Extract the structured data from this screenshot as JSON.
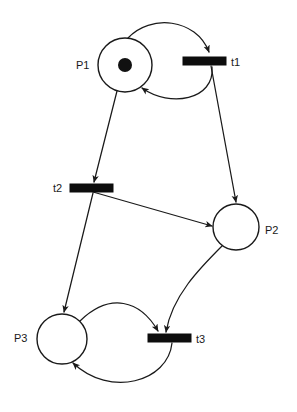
{
  "diagram": {
    "width": 297,
    "height": 412,
    "background_color": "#ffffff",
    "stroke_color": "#1a1a1a",
    "fill_color": "#0d0d0d"
  },
  "places": [
    {
      "id": "P1",
      "label": "P1",
      "cx": 125,
      "cy": 65,
      "r": 27,
      "tokens": 1,
      "token_radius": 7,
      "label_x": 76,
      "label_y": 69
    },
    {
      "id": "P2",
      "label": "P2",
      "cx": 236,
      "cy": 227,
      "r": 23,
      "tokens": 0,
      "token_radius": 0,
      "label_x": 265,
      "label_y": 234
    },
    {
      "id": "P3",
      "label": "P3",
      "cx": 62,
      "cy": 339,
      "r": 25,
      "tokens": 0,
      "token_radius": 0,
      "label_x": 14,
      "label_y": 342
    }
  ],
  "transitions": [
    {
      "id": "t1",
      "label": "t1",
      "x": 183,
      "y": 57,
      "width": 43,
      "height": 8,
      "label_x": 231,
      "label_y": 66
    },
    {
      "id": "t2",
      "label": "t2",
      "x": 70,
      "y": 184,
      "width": 43,
      "height": 8,
      "label_x": 53,
      "label_y": 192
    },
    {
      "id": "t3",
      "label": "t3",
      "x": 148,
      "y": 334,
      "width": 43,
      "height": 8,
      "label_x": 196,
      "label_y": 343
    }
  ],
  "arcs": [
    {
      "id": "arc-p1-to-t1",
      "from": "P1",
      "to": "t1",
      "shape": "curve",
      "path": "M 128 38 C 150 14 196 18 209 52",
      "arrowhead": true,
      "description": "P1 top curves right and down into t1"
    },
    {
      "id": "arc-t1-to-p1",
      "from": "t1",
      "to": "P1",
      "shape": "curve",
      "path": "M 212 67 C 215 100 170 108 142 88",
      "arrowhead": true,
      "description": "t1 curves left and up back into P1 lower right"
    },
    {
      "id": "arc-t1-to-p2",
      "from": "t1",
      "to": "P2",
      "shape": "line",
      "path": "M 211 66 L 236 202",
      "arrowhead": true,
      "description": "straight line from t1 down to P2 top"
    },
    {
      "id": "arc-p1-to-t2",
      "from": "P1",
      "to": "t2",
      "shape": "line",
      "path": "M 117 91 L 94 182",
      "arrowhead": true,
      "description": "straight line from P1 bottom down-left to t2"
    },
    {
      "id": "arc-t2-to-p2",
      "from": "t2",
      "to": "P2",
      "shape": "line",
      "path": "M 93 192 L 212 226",
      "arrowhead": true,
      "description": "straight line from t2 right and down to P2 left"
    },
    {
      "id": "arc-t2-to-p3",
      "from": "t2",
      "to": "P3",
      "shape": "line",
      "path": "M 93 193 L 64 312",
      "arrowhead": true,
      "description": "straight line from t2 down-left to P3 top"
    },
    {
      "id": "arc-p2-to-t3",
      "from": "P2",
      "to": "t3",
      "shape": "curve",
      "path": "M 222 246 C 200 268 172 296 166 332",
      "arrowhead": true,
      "description": "curve from P2 bottom-left down into t3"
    },
    {
      "id": "arc-p3-to-t3",
      "from": "P3",
      "to": "t3",
      "shape": "curve",
      "path": "M 80 321 C 110 292 140 300 158 331",
      "arrowhead": true,
      "description": "arc from P3 top-right up and over into t3"
    },
    {
      "id": "arc-t3-to-p3",
      "from": "t3",
      "to": "P3",
      "shape": "curve",
      "path": "M 172 343 C 168 382 110 398 73 363",
      "arrowhead": true,
      "description": "arc from t3 bottom sweeping left into P3 bottom"
    }
  ]
}
